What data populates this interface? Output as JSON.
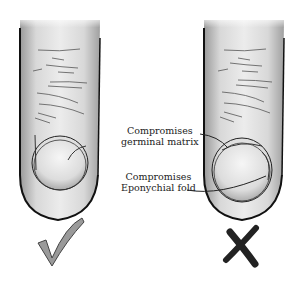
{
  "figure": {
    "left_panel": {
      "description": "finger with correct nail placement",
      "verdict_icon": "check-mark-icon",
      "verdict_color": "#9a9a9a"
    },
    "right_panel": {
      "description": "finger with incorrect nail placement",
      "verdict_icon": "x-mark-icon",
      "verdict_color": "#2a2a2a",
      "annotations": [
        {
          "line1": "Compromises",
          "line2": "germinal matrix"
        },
        {
          "line1": "Compromises",
          "line2": "Eponychial fold"
        }
      ]
    }
  }
}
